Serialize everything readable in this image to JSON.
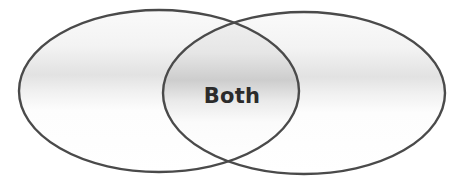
{
  "diagram": {
    "type": "venn",
    "sets": [
      {
        "id": "left",
        "label": ""
      },
      {
        "id": "right",
        "label": ""
      }
    ],
    "intersection": {
      "label": "Both"
    }
  },
  "colors": {
    "stroke": "#4a4a4a",
    "fill_light": "#ffffff",
    "fill_shade": "#e4e4e4",
    "overlap_shade": "#cfcfcf",
    "text": "#2b2b2b"
  }
}
